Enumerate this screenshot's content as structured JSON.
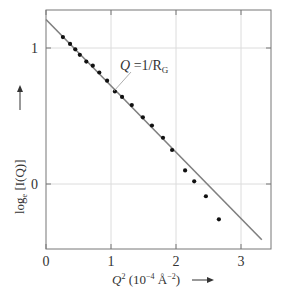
{
  "chart_data": {
    "type": "scatter",
    "title": "",
    "xlabel": "Q² (10⁻⁴ Å⁻²)",
    "ylabel": "log_e [I(Q)]",
    "xlim": [
      0,
      3.45
    ],
    "ylim": [
      -0.48,
      1.27
    ],
    "x_ticks": [
      0,
      1,
      2,
      3
    ],
    "y_ticks": [
      0,
      1
    ],
    "x_tick_labels": [
      "0",
      "1",
      "2",
      "3"
    ],
    "y_tick_labels": [
      "0",
      "1"
    ],
    "grid": true,
    "legend": null,
    "series": [
      {
        "name": "measured",
        "kind": "points",
        "color": "#111111",
        "x": [
          0.26,
          0.37,
          0.45,
          0.52,
          0.62,
          0.72,
          0.82,
          0.94,
          1.06,
          1.17,
          1.32,
          1.49,
          1.63,
          1.8,
          1.94,
          2.14,
          2.28,
          2.46,
          2.66
        ],
        "y": [
          1.08,
          1.03,
          0.99,
          0.95,
          0.9,
          0.87,
          0.82,
          0.76,
          0.68,
          0.64,
          0.58,
          0.49,
          0.43,
          0.34,
          0.25,
          0.1,
          0.02,
          -0.09,
          -0.26
        ]
      },
      {
        "name": "Guinier fit",
        "kind": "line",
        "color": "#808080",
        "x": [
          0,
          3.32
        ],
        "y": [
          1.21,
          -0.41
        ]
      }
    ],
    "annotations": [
      {
        "text": "Q = 1/R_G",
        "x": 1.75,
        "y": 0.85,
        "points_to": {
          "x": 1.05,
          "y": 0.68
        }
      }
    ]
  },
  "labels": {
    "x_axis_main": "Q",
    "x_axis_sup": "2",
    "x_axis_units_pre": " (10",
    "x_axis_exp": "−4",
    "x_axis_units_mid": " Å",
    "x_axis_exp2": "−2",
    "x_axis_units_post": ")",
    "x_arrow": "→",
    "y_axis_log": "log",
    "y_axis_sub": "e",
    "y_axis_main": " [I(Q)]",
    "annotation_q": "Q",
    "annotation_eq": " =1/R",
    "annotation_sub": "G"
  }
}
